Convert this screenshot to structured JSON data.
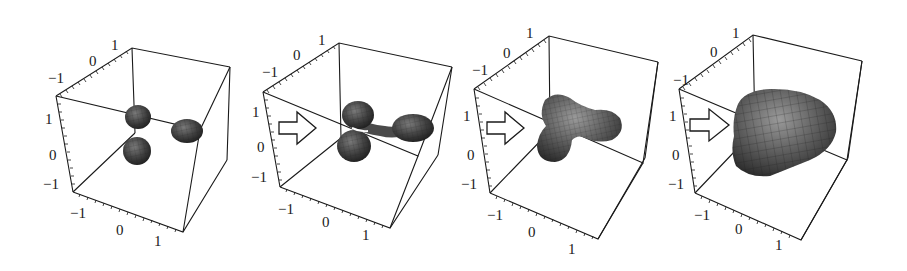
{
  "figure": {
    "panels": [
      {
        "id": "panel-1",
        "stage": "separated lobes",
        "has_arrow": false,
        "axis_labels": {
          "back_axis": [
            "-1",
            "0",
            "1"
          ],
          "vertical_axis": [
            "1",
            "0",
            "-1"
          ],
          "front_axis": [
            "-1",
            "0",
            "1"
          ]
        }
      },
      {
        "id": "panel-2",
        "stage": "lobes connecting",
        "has_arrow": true,
        "axis_labels": {
          "back_axis": [
            "-1",
            "0",
            "1"
          ],
          "vertical_axis": [
            "1",
            "0",
            "-1"
          ],
          "front_axis": [
            "-1",
            "0",
            "1"
          ]
        }
      },
      {
        "id": "panel-3",
        "stage": "three-lobed merged surface",
        "has_arrow": true,
        "axis_labels": {
          "back_axis": [
            "-1",
            "0",
            "1"
          ],
          "vertical_axis": [
            "1",
            "0",
            "-1"
          ],
          "front_axis": [
            "-1",
            "0",
            "1"
          ]
        }
      },
      {
        "id": "panel-4",
        "stage": "single rounded body",
        "has_arrow": true,
        "axis_labels": {
          "back_axis": [
            "-1",
            "0",
            "1"
          ],
          "vertical_axis": [
            "1",
            "0",
            "-1"
          ],
          "front_axis": [
            "-1",
            "0",
            "1"
          ]
        }
      }
    ],
    "colors": {
      "line": "#1a1a1a",
      "surface_dark": "#2e2e2e",
      "surface_mid": "#5a5a5a",
      "surface_light": "#8a8a8a",
      "background": "#ffffff"
    }
  }
}
